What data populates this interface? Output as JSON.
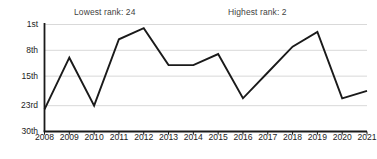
{
  "chart_data": {
    "type": "line",
    "title": "",
    "subtitle": "",
    "xlabel": "",
    "ylabel": "",
    "categories": [
      "2008",
      "2009",
      "2010",
      "2011",
      "2012",
      "2013",
      "2014",
      "2015",
      "2016",
      "2017",
      "2018",
      "2019",
      "2020",
      "2021"
    ],
    "x": [
      2008,
      2009,
      2010,
      2011,
      2012,
      2013,
      2014,
      2015,
      2016,
      2017,
      2018,
      2019,
      2020,
      2021
    ],
    "values": [
      24,
      10,
      23,
      5,
      2,
      12,
      12,
      9,
      21,
      14,
      7,
      3,
      21,
      19
    ],
    "series": [
      {
        "name": "Rank",
        "values": [
          24,
          10,
          23,
          5,
          2,
          12,
          12,
          9,
          21,
          14,
          7,
          3,
          21,
          19
        ]
      }
    ],
    "ylim": [
      1,
      30
    ],
    "y_inverted": true,
    "ytick_values": [
      1,
      8,
      15,
      23,
      30
    ],
    "ytick_labels": [
      "1st",
      "8th",
      "15th",
      "23rd",
      "30th"
    ],
    "xtick_labels": [
      "2008",
      "2009",
      "2010",
      "2011",
      "2012",
      "2013",
      "2014",
      "2015",
      "2016",
      "2017",
      "2018",
      "2019",
      "2020",
      "2021"
    ],
    "grid": true,
    "grid_axis": "y",
    "legend": false,
    "legend_position": "none",
    "line_color": "#1a1a1a",
    "grid_color": "#d9d9d9",
    "axis_color": "#1a1a1a",
    "background_color": "#ffffff",
    "annotations": [
      {
        "name": "lowest-rank",
        "text": "Lowest rank: 24",
        "value": 24
      },
      {
        "name": "highest-rank",
        "text": "Highest rank: 2",
        "value": 2
      }
    ]
  },
  "annotations": {
    "lowest": "Lowest rank: 24",
    "highest": "Highest rank: 2"
  },
  "axes": {
    "y": {
      "labels": [
        "1st",
        "8th",
        "15th",
        "23rd",
        "30th"
      ]
    },
    "x": {
      "labels": [
        "2008",
        "2009",
        "2010",
        "2011",
        "2012",
        "2013",
        "2014",
        "2015",
        "2016",
        "2017",
        "2018",
        "2019",
        "2020",
        "2021"
      ]
    }
  }
}
